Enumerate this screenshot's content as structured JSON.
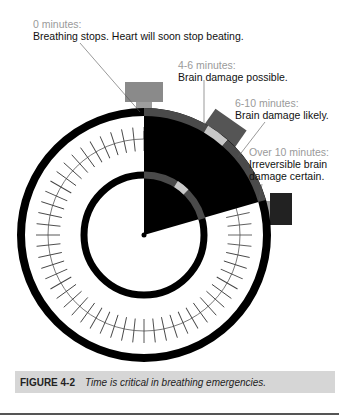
{
  "figure": {
    "labels": [
      {
        "time": "0 minutes:",
        "desc": [
          "Breathing stops. Heart will soon stop beating."
        ]
      },
      {
        "time": "4-6 minutes:",
        "desc": [
          "Brain damage possible."
        ]
      },
      {
        "time": "6-10 minutes:",
        "desc": [
          "Brain damage likely."
        ]
      },
      {
        "time": "Over 10 minutes:",
        "desc": [
          "Irreversible brain",
          "damage certain."
        ]
      }
    ],
    "caption": {
      "number": "FIGURE 4-2",
      "text": "Time is critical in breathing emergencies."
    },
    "colors": {
      "dial": "#000000",
      "elapsed": "#000000",
      "band": "#4a4a4a",
      "marker": "#c8c8c8",
      "button": "#7a7a7a",
      "caption_bg": "#d6d6d6"
    }
  }
}
